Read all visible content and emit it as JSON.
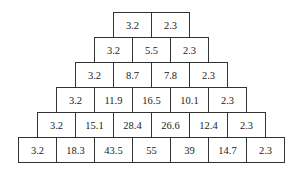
{
  "pyramid": {
    "rows": [
      [
        "3.2",
        "2.3"
      ],
      [
        "3.2",
        "5.5",
        "2.3"
      ],
      [
        "3.2",
        "8.7",
        "7.8",
        "2.3"
      ],
      [
        "3.2",
        "11.9",
        "16.5",
        "10.1",
        "2.3"
      ],
      [
        "3.2",
        "15.1",
        "28.4",
        "26.6",
        "12.4",
        "2.3"
      ],
      [
        "3.2",
        "18.3",
        "43.5",
        "55",
        "39",
        "14.7",
        "2.3"
      ]
    ]
  }
}
